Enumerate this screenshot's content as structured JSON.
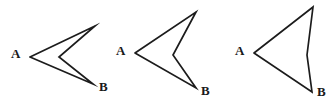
{
  "figure": {
    "width": 334,
    "height": 106,
    "background_color": "#ffffff",
    "stroke_color": "#1c1c1c",
    "label_color": "#1a1a1a",
    "shapes": [
      {
        "id": "shape-1",
        "name": "arrowhead-chevron-narrow",
        "description": "Concave arrowhead: narrow dart with a deep notch, vertex A at left",
        "points": "30,57 95,26 59,57 93,84 30,57",
        "labels": [
          {
            "text": "A",
            "x": 11,
            "y": 47
          },
          {
            "text": "B",
            "x": 99,
            "y": 80
          }
        ]
      },
      {
        "id": "shape-2",
        "name": "arrowhead-chevron-medium",
        "description": "Concave arrowhead: wider dart with a shallower notch, vertex A at left",
        "points": "135,53 196,12 173,55 196,88 135,53",
        "labels": [
          {
            "text": "A",
            "x": 116,
            "y": 44
          },
          {
            "text": "B",
            "x": 201,
            "y": 84
          }
        ]
      },
      {
        "id": "shape-3",
        "name": "arrowhead-chevron-wide",
        "description": "Nearly triangular arrowhead: very shallow notch on right edge, vertex A at left",
        "points": "254,53 313,7 307,55 312,92 254,53",
        "labels": [
          {
            "text": "A",
            "x": 235,
            "y": 44
          },
          {
            "text": "B",
            "x": 317,
            "y": 85
          }
        ]
      }
    ]
  }
}
